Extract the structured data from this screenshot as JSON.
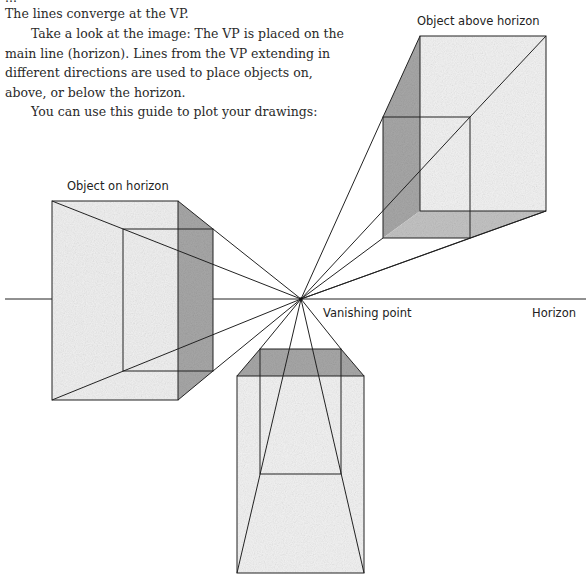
{
  "text": {
    "line_partial": "...",
    "para1": "The lines converge at the VP.",
    "para2": "Take a look at the image: The VP is placed on the main line (horizon). Lines from the VP extending in different directions are used to place objects on, above, or below the horizon.",
    "para3": "You can use this guide to plot your drawings:"
  },
  "labels": {
    "above": "Object above horizon",
    "on": "Object on horizon",
    "vp": "Vanishing point",
    "horizon": "Horizon"
  },
  "colors": {
    "line": "#222222",
    "shade": "#9a9a9a",
    "fill": "#eeeeee"
  }
}
